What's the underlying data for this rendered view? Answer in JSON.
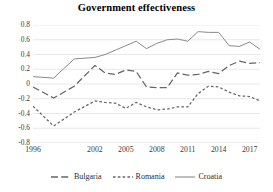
{
  "chart_data": {
    "type": "line",
    "title": "Government effectiveness",
    "xlabel": "",
    "ylabel": "",
    "ylim": [
      -0.8,
      0.8
    ],
    "xlim": [
      1996,
      2018
    ],
    "grid": true,
    "legend_position": "bottom",
    "y_ticks": [
      "0.8",
      "0.6",
      "0.4",
      "0.2",
      "0",
      "-0.2",
      "-0.4",
      "-0.6",
      "-0.8"
    ],
    "y_tick_values": [
      0.8,
      0.6,
      0.4,
      0.2,
      0,
      -0.2,
      -0.4,
      -0.6,
      -0.8
    ],
    "x_ticks": [
      "1996",
      "2002",
      "2005",
      "2008",
      "2011",
      "2014",
      "2017"
    ],
    "x_tick_values": [
      1996,
      2002,
      2005,
      2008,
      2011,
      2014,
      2017
    ],
    "x": [
      1996,
      1998,
      2000,
      2002,
      2003,
      2004,
      2005,
      2006,
      2007,
      2008,
      2009,
      2010,
      2011,
      2012,
      2013,
      2014,
      2015,
      2016,
      2017,
      2018
    ],
    "series": [
      {
        "name": "Bulgaria",
        "style": "long-dash",
        "color": "#666666",
        "values": [
          -0.04,
          -0.19,
          -0.03,
          0.25,
          0.15,
          0.13,
          0.19,
          0.17,
          -0.04,
          -0.05,
          -0.05,
          0.15,
          0.12,
          0.13,
          0.17,
          0.14,
          0.25,
          0.31,
          0.28,
          0.29
        ]
      },
      {
        "name": "Romania",
        "style": "short-dash",
        "color": "#666666",
        "values": [
          -0.3,
          -0.57,
          -0.38,
          -0.23,
          -0.25,
          -0.26,
          -0.33,
          -0.25,
          -0.31,
          -0.35,
          -0.34,
          -0.31,
          -0.31,
          -0.13,
          -0.03,
          -0.04,
          -0.11,
          -0.16,
          -0.17,
          -0.23
        ]
      },
      {
        "name": "Croatia",
        "style": "solid",
        "color": "#8a8a8a",
        "values": [
          0.1,
          0.08,
          0.34,
          0.36,
          0.4,
          0.46,
          0.52,
          0.58,
          0.48,
          0.55,
          0.6,
          0.61,
          0.58,
          0.71,
          0.7,
          0.7,
          0.52,
          0.51,
          0.57,
          0.47
        ]
      }
    ]
  },
  "legend": {
    "items": [
      {
        "label": "Bulgaria"
      },
      {
        "label": "Romania"
      },
      {
        "label": "Croatia"
      }
    ]
  }
}
